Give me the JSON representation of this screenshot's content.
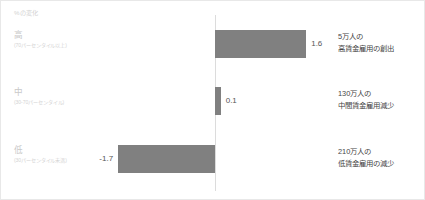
{
  "axis_header": "%の変化",
  "categories": [
    {
      "main": "高",
      "sub": "(70パーセンタイル以上)",
      "value_label": "1.6",
      "annotation_line1": "5万人の",
      "annotation_line2": "高賃金雇用の創出"
    },
    {
      "main": "中",
      "sub": "(30-70パーセンタイル)",
      "value_label": "0.1",
      "annotation_line1": "130万人の",
      "annotation_line2": "中間賃金雇用減少"
    },
    {
      "main": "低",
      "sub": "(30パーセンタイル未満)",
      "value_label": "-1.7",
      "annotation_line1": "210万人の",
      "annotation_line2": "低賃金雇用の減少"
    }
  ],
  "colors": {
    "bar": "#808080",
    "axis_line": "#dcdcdc",
    "category_label": "#c9c9c9",
    "annotation_text": "#454545",
    "value_text": "#555555",
    "background": "#ffffff"
  },
  "chart_data": {
    "type": "bar",
    "orientation": "horizontal",
    "title": "",
    "subtitle": "",
    "xlabel": "%の変化",
    "ylabel": "",
    "categories": [
      "高",
      "中",
      "低"
    ],
    "category_sublabels": [
      "(70パーセンタイル以上)",
      "(30-70パーセンタイル)",
      "(30パーセンタイル未満)"
    ],
    "values": [
      1.6,
      0.1,
      -1.7
    ],
    "data_labels": [
      "1.6",
      "0.1",
      "-1.7"
    ],
    "annotations": [
      "5万人の 高賃金雇用の創出",
      "130万人の 中間賃金雇用減少",
      "210万人の 低賃金雇用の減少"
    ],
    "xlim": [
      -2.0,
      2.0
    ],
    "grid": false,
    "legend": "none",
    "zero_line": true,
    "bar_color": "#808080"
  }
}
